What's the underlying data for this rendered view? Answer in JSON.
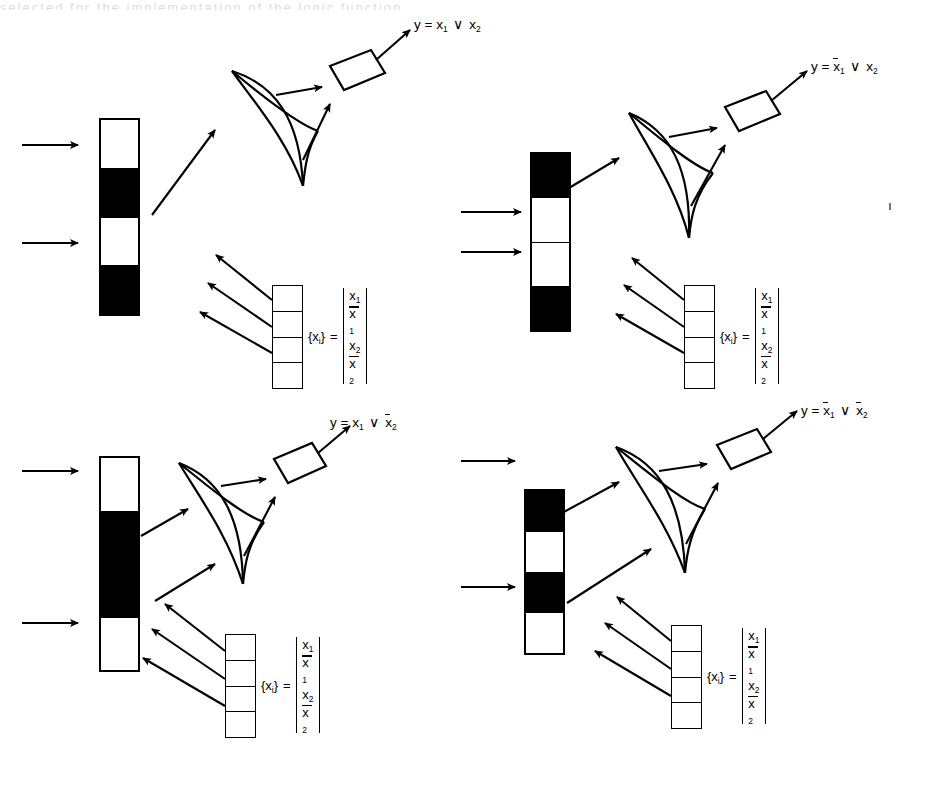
{
  "figure": {
    "type": "optical-logic-diagram",
    "panel_count": 4,
    "cropped_top_caption": "selected for the implementation of the logic function"
  },
  "legend": {
    "set_label": "{x",
    "set_label_sub": "i",
    "set_label_close": "}",
    "equals": "=",
    "entries": [
      {
        "base": "x",
        "sub": "1",
        "bar": false
      },
      {
        "base": "x",
        "sub": "1",
        "bar": true
      },
      {
        "base": "x",
        "sub": "2",
        "bar": false
      },
      {
        "base": "x",
        "sub": "2",
        "bar": true
      }
    ],
    "code_cells": 4
  },
  "panels": [
    {
      "id": "panel-1",
      "position": "top-left",
      "register": {
        "cells": [
          "off",
          "on",
          "off",
          "on"
        ],
        "input_arrow_cells": [
          1,
          3
        ]
      },
      "output": {
        "prefix": "y",
        "equals": "=",
        "operand1": {
          "base": "x",
          "sub": "1",
          "bar": false
        },
        "operator": "∨",
        "operand2": {
          "base": "x",
          "sub": "2",
          "bar": false
        }
      }
    },
    {
      "id": "panel-2",
      "position": "top-right",
      "register": {
        "cells": [
          "on",
          "off",
          "off",
          "on"
        ],
        "input_arrow_cells": [
          2,
          3
        ]
      },
      "output": {
        "prefix": "y",
        "equals": "=",
        "operand1": {
          "base": "x",
          "sub": "1",
          "bar": true
        },
        "operator": "∨",
        "operand2": {
          "base": "x",
          "sub": "2",
          "bar": false
        }
      }
    },
    {
      "id": "panel-3",
      "position": "bottom-left",
      "register": {
        "cells": [
          "off",
          "on",
          "on",
          "off"
        ],
        "input_arrow_cells": [
          1,
          4
        ]
      },
      "output": {
        "prefix": "y",
        "equals": "=",
        "operand1": {
          "base": "x",
          "sub": "1",
          "bar": false
        },
        "operator": "∨",
        "operand2": {
          "base": "x",
          "sub": "2",
          "bar": true
        }
      }
    },
    {
      "id": "panel-4",
      "position": "bottom-right",
      "register": {
        "cells": [
          "on",
          "off",
          "on",
          "off"
        ],
        "input_arrow_cells": [
          2,
          4
        ]
      },
      "output": {
        "prefix": "y",
        "equals": "=",
        "operand1": {
          "base": "x",
          "sub": "1",
          "bar": true
        },
        "operator": "∨",
        "operand2": {
          "base": "x",
          "sub": "2",
          "bar": true
        }
      }
    }
  ],
  "colors": {
    "ink": "#000000",
    "paper": "#ffffff"
  }
}
